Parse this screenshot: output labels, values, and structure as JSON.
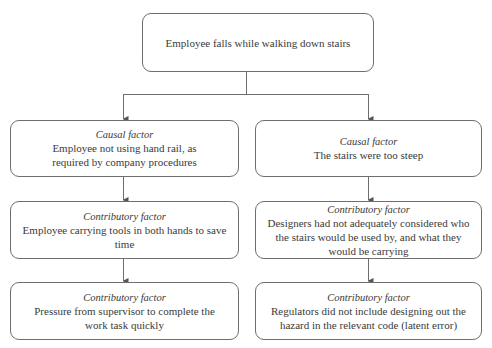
{
  "diagram": {
    "type": "cause-analysis-tree",
    "root": {
      "text": "Employee falls while walking down stairs"
    },
    "branches": [
      {
        "name": "left",
        "nodes": [
          {
            "label": "Causal factor",
            "text": "Employee not using hand rail, as required by company procedures"
          },
          {
            "label": "Contributory factor",
            "text": "Employee carrying tools in both hands to save time"
          },
          {
            "label": "Contributory factor",
            "text": "Pressure from supervisor to complete the work task quickly"
          }
        ]
      },
      {
        "name": "right",
        "nodes": [
          {
            "label": "Causal factor",
            "text": "The stairs were too steep"
          },
          {
            "label": "Contributory factor",
            "text": "Designers had not adequately considered who the stairs would be used by, and what they would be carrying"
          },
          {
            "label": "Contributory factor",
            "text": "Regulators did not include designing out the hazard in the relevant code (latent error)"
          }
        ]
      }
    ],
    "colors": {
      "border": "#6e6e6e",
      "text": "#3a3a3a",
      "background": "#ffffff"
    }
  }
}
